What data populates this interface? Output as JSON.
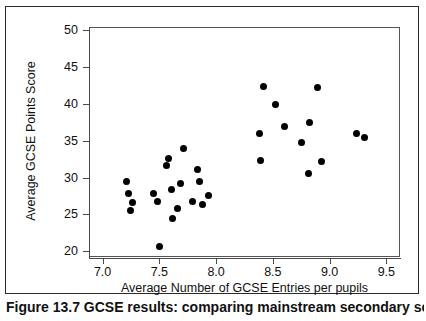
{
  "chart_data": {
    "type": "scatter",
    "title": "",
    "xlabel": "Average Number of GCSE Entries per pupils",
    "ylabel": "Average GCSE Points Score",
    "xlim": [
      6.88,
      9.62
    ],
    "ylim": [
      19.1,
      50.4
    ],
    "xticks": [
      "7.0",
      "7.5",
      "8.0",
      "8.5",
      "9.0",
      "9.5"
    ],
    "xtick_values": [
      7.0,
      7.5,
      8.0,
      8.5,
      9.0,
      9.5
    ],
    "yticks": [
      "20",
      "25",
      "30",
      "35",
      "40",
      "45",
      "50"
    ],
    "ytick_values": [
      20,
      25,
      30,
      35,
      40,
      45,
      50
    ],
    "grid": false,
    "legend": false,
    "marker": "filled-circle",
    "marker_color": "#000000",
    "points": [
      {
        "x": 7.21,
        "y": 29.5
      },
      {
        "x": 7.23,
        "y": 27.9
      },
      {
        "x": 7.26,
        "y": 26.6
      },
      {
        "x": 7.25,
        "y": 25.6
      },
      {
        "x": 7.45,
        "y": 27.8
      },
      {
        "x": 7.48,
        "y": 26.8
      },
      {
        "x": 7.5,
        "y": 20.6
      },
      {
        "x": 7.56,
        "y": 31.6
      },
      {
        "x": 7.58,
        "y": 32.6
      },
      {
        "x": 7.61,
        "y": 28.4
      },
      {
        "x": 7.62,
        "y": 24.4
      },
      {
        "x": 7.66,
        "y": 25.8
      },
      {
        "x": 7.69,
        "y": 29.2
      },
      {
        "x": 7.71,
        "y": 33.9
      },
      {
        "x": 7.79,
        "y": 26.7
      },
      {
        "x": 7.84,
        "y": 31.1
      },
      {
        "x": 7.85,
        "y": 29.5
      },
      {
        "x": 7.88,
        "y": 26.3
      },
      {
        "x": 7.93,
        "y": 27.6
      },
      {
        "x": 8.38,
        "y": 36.0
      },
      {
        "x": 8.39,
        "y": 32.3
      },
      {
        "x": 8.42,
        "y": 42.3
      },
      {
        "x": 8.52,
        "y": 39.9
      },
      {
        "x": 8.6,
        "y": 36.9
      },
      {
        "x": 8.75,
        "y": 34.8
      },
      {
        "x": 8.81,
        "y": 30.5
      },
      {
        "x": 8.82,
        "y": 37.4
      },
      {
        "x": 8.89,
        "y": 42.2
      },
      {
        "x": 8.93,
        "y": 32.2
      },
      {
        "x": 9.24,
        "y": 36.0
      },
      {
        "x": 9.31,
        "y": 35.4
      }
    ],
    "n_points": 31
  },
  "figure": {
    "caption": "Figure 13.7 GCSE results: comparing mainstream secondary schools"
  }
}
